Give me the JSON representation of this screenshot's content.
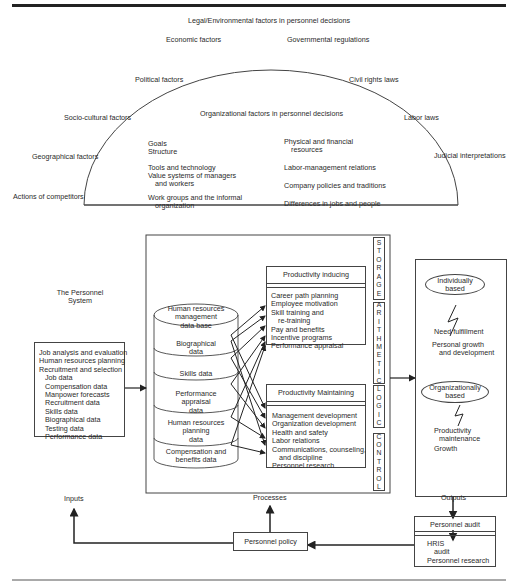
{
  "environment": {
    "title": "Legal/Environmental factors in personnel decisions",
    "outer_factors_left": [
      "Economic factors",
      "Political factors",
      "Socio-cultural factors",
      "Geographical factors",
      "Actions of competitors"
    ],
    "outer_factors_right": [
      "Governmental regulations",
      "Civil rights laws",
      "Labor laws",
      "Judicial interpretations"
    ]
  },
  "organization": {
    "title": "Organizational factors in personnel decisions",
    "left_items": [
      "Goals",
      "Structure",
      "Tools and technology",
      "Value systems of managers",
      "and workers",
      "Work groups and the informal",
      "organization"
    ],
    "right_items": [
      "Physical and financial",
      "resources",
      "Labor-management relations",
      "Company policies and traditions",
      "Differences in jobs and people"
    ]
  },
  "system": {
    "label_line1": "The Personnel",
    "label_line2": "System"
  },
  "inputs_box": {
    "items": [
      "Job analysis and evaluation",
      "Human resources planning",
      "Recruitment and selection",
      "Job data",
      "Compensation data",
      "Manpower forecasts",
      "Recruitment data",
      "Skills data",
      "Biographical data",
      "Testing data",
      "Performance data"
    ]
  },
  "database": {
    "top": [
      "Human resources",
      "management",
      "data base"
    ],
    "segments": [
      [
        "Biographical",
        "data"
      ],
      [
        "Skills data"
      ],
      [
        "Performance",
        "appraisal",
        "data"
      ],
      [
        "Human resources",
        "planning",
        "data"
      ],
      [
        "Compensation and",
        "benefits data"
      ]
    ]
  },
  "productivity_inducing": {
    "title": "Productivity inducing",
    "items": [
      "Career path planning",
      "Employee motivation",
      "Skill training and",
      "re-training",
      "Pay and benefits",
      "Incentive programs",
      "Performance appraisal"
    ]
  },
  "productivity_maintaining": {
    "title": "Productivity Maintaining",
    "items": [
      "Management development",
      "Organization development",
      "Health and safety",
      "Labor relations",
      "Communications, counseling,",
      "and discipline",
      "Personnel research"
    ]
  },
  "computer_functions": {
    "storage": [
      "S",
      "T",
      "O",
      "R",
      "A",
      "G",
      "E"
    ],
    "arithmetic": [
      "A",
      "R",
      "I",
      "T",
      "H",
      "M",
      "E",
      "T",
      "I",
      "C"
    ],
    "logic": [
      "L",
      "O",
      "G",
      "I",
      "C"
    ],
    "control": [
      "C",
      "O",
      "N",
      "T",
      "R",
      "O",
      "L"
    ]
  },
  "outcomes": {
    "individual_oval": [
      "Individually",
      "based"
    ],
    "individual_items": [
      "Need fulfillment",
      "Personal growth",
      "and development"
    ],
    "org_oval": [
      "Organizationally",
      "based"
    ],
    "org_items": [
      "Productivity",
      "maintenance",
      "Growth"
    ]
  },
  "flow_labels": {
    "inputs": "Inputs",
    "processes": "Processes",
    "outputs": "Outputs"
  },
  "personnel_policy": {
    "label": "Personnel policy"
  },
  "personnel_audit": {
    "title": "Personnel audit",
    "items": [
      "HRIS",
      "audit",
      "Personnel research"
    ]
  }
}
